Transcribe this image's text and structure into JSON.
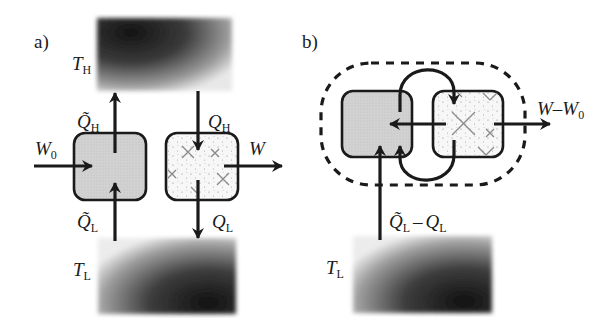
{
  "panel_a": {
    "label": "a)",
    "hot_reservoir": {
      "symbol": "T",
      "subscript": "H"
    },
    "cold_reservoir": {
      "symbol": "T",
      "subscript": "L"
    },
    "heat_pump": {
      "name": "reversible engine (shaded)",
      "heat_out": {
        "symbol": "Q̃",
        "subscript": "H"
      },
      "heat_in": {
        "symbol": "Q̃",
        "subscript": "L"
      },
      "work_in": {
        "symbol": "W",
        "subscript": "0"
      }
    },
    "engine": {
      "name": "engine (dotted)",
      "heat_in": {
        "symbol": "Q",
        "subscript": "H"
      },
      "heat_out": {
        "symbol": "Q",
        "subscript": "L"
      },
      "work_out": {
        "symbol": "W",
        "subscript": ""
      }
    }
  },
  "panel_b": {
    "label": "b)",
    "cold_reservoir": {
      "symbol": "T",
      "subscript": "L"
    },
    "combined_work": {
      "main": "W–W",
      "subscript": "0"
    },
    "combined_heat": {
      "a": "Q̃",
      "a_sub": "L",
      "op": "–",
      "b": "Q",
      "b_sub": "L"
    }
  },
  "colors": {
    "ink": "#1a1a1a",
    "shaded_box": "#d4d4d4",
    "dotted_box": "#f7f7f7",
    "dashed_boundary": "#1a1a1a",
    "reservoir_dark": "#141414"
  }
}
